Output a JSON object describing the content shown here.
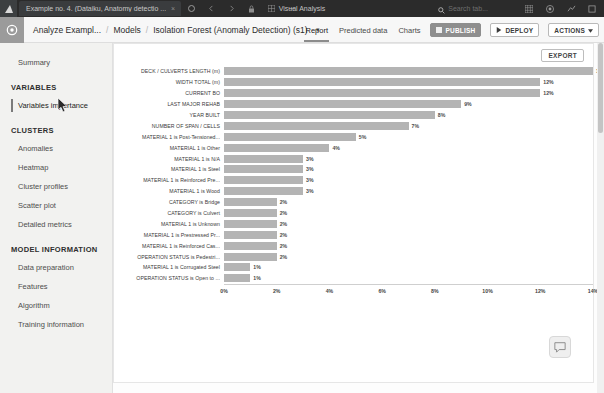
{
  "browser": {
    "tab_title": "Example no. 4. (Dataiku, Anatomy detectio ...",
    "tab_close": "×",
    "tab_new": "+",
    "window_title": "Visual Analysis",
    "search_placeholder": "Search tab...",
    "icons": {
      "app_logo": "dataiku-logo-icon",
      "reload": "reload-icon",
      "back": "back-icon",
      "forward": "forward-icon",
      "lock": "lock-icon",
      "grid": "grid-icon",
      "minimize": "minimize-icon",
      "search": "search-icon",
      "apps": "apps-grid-icon",
      "profile": "profile-icon",
      "activity": "activity-icon",
      "more": "more-icon"
    }
  },
  "header": {
    "logo": "gear-icon",
    "breadcrumb": [
      {
        "label": "Analyze Exampl...",
        "strong": false
      },
      {
        "label": "Models",
        "strong": false
      },
      {
        "label": "Isolation Forest (Anomaly Detection) (s1)",
        "strong": false
      }
    ],
    "separator": "/",
    "caret": "▾",
    "tabs": [
      {
        "label": "Report",
        "active": true
      },
      {
        "label": "Predicted data",
        "active": false
      },
      {
        "label": "Charts",
        "active": false
      }
    ],
    "buttons": [
      {
        "label": "PUBLISH",
        "icon": "publish-icon",
        "primary": true
      },
      {
        "label": "DEPLOY",
        "icon": "play-icon",
        "primary": false
      },
      {
        "label": "ACTIONS",
        "icon": "caret-down-icon",
        "primary": false
      }
    ]
  },
  "sidebar": {
    "items": [
      {
        "label": "Summary",
        "type": "item",
        "selected": false
      },
      {
        "label": "VARIABLES",
        "type": "section"
      },
      {
        "label": "Variables importance",
        "type": "item",
        "selected": true
      },
      {
        "label": "CLUSTERS",
        "type": "section"
      },
      {
        "label": "Anomalies",
        "type": "item",
        "selected": false
      },
      {
        "label": "Heatmap",
        "type": "item",
        "selected": false
      },
      {
        "label": "Cluster profiles",
        "type": "item",
        "selected": false
      },
      {
        "label": "Scatter plot",
        "type": "item",
        "selected": false
      },
      {
        "label": "Detailed metrics",
        "type": "item",
        "selected": false
      },
      {
        "label": "MODEL INFORMATION",
        "type": "section"
      },
      {
        "label": "Data preparation",
        "type": "item",
        "selected": false
      },
      {
        "label": "Features",
        "type": "item",
        "selected": false
      },
      {
        "label": "Algorithm",
        "type": "item",
        "selected": false
      },
      {
        "label": "Training information",
        "type": "item",
        "selected": false
      }
    ]
  },
  "main": {
    "export_label": "EXPORT",
    "chat_icon": "chat-icon"
  },
  "chart_data": {
    "type": "bar",
    "orientation": "horizontal",
    "title": "",
    "xlabel": "",
    "ylabel": "",
    "xlim": [
      0,
      14
    ],
    "grid": false,
    "legend": false,
    "bar_color": "#b4b4b4",
    "ticks": [
      "0%",
      "2%",
      "4%",
      "6%",
      "8%",
      "10%",
      "12%",
      "14%"
    ],
    "tick_values": [
      0,
      2,
      4,
      6,
      8,
      10,
      12,
      14
    ],
    "categories": [
      "DECK / CULVERTS LENGTH (m)",
      "WIDTH TOTAL (m)",
      "CURRENT BO",
      "LAST MAJOR REHAB",
      "YEAR BUILT",
      "NUMBER OF SPAN / CELLS",
      "MATERIAL 1 is Post-Tensioned...",
      "MATERIAL 1 is Other",
      "MATERIAL 1 is N/A",
      "MATERIAL 1 is Steel",
      "MATERIAL 1 is Reinforced Pre...",
      "MATERIAL 1 is Wood",
      "CATEGORY is Bridge",
      "CATEGORY is Culvert",
      "MATERIAL 1 is Unknown",
      "MATERIAL 1 is Prestressed Pr...",
      "MATERIAL 1 is Reinforced Cas...",
      "OPERATION STATUS is Pedestri...",
      "MATERIAL 1 is Corrugated Steel",
      "OPERATION STATUS is Open to ..."
    ],
    "values": [
      14,
      12,
      12,
      9,
      8,
      7,
      5,
      4,
      3,
      3,
      3,
      3,
      2,
      2,
      2,
      2,
      2,
      2,
      1,
      1
    ],
    "labels": [
      "14%",
      "12%",
      "12%",
      "9%",
      "8%",
      "7%",
      "5%",
      "4%",
      "3%",
      "3%",
      "3%",
      "3%",
      "2%",
      "2%",
      "2%",
      "2%",
      "2%",
      "2%",
      "1%",
      "1%"
    ]
  }
}
